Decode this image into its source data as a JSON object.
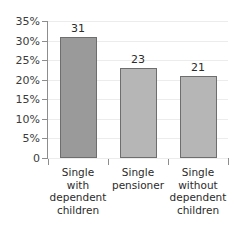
{
  "chart_data": {
    "type": "bar",
    "title": "",
    "subtitle": "",
    "xlabel": "",
    "ylabel": "",
    "categories": [
      "Single with dependent children",
      "Single pensioner",
      "Single without dependent children"
    ],
    "category_lines": [
      [
        "Single",
        "with",
        "dependent",
        "children"
      ],
      [
        "Single",
        "pensioner"
      ],
      [
        "Single",
        "without",
        "dependent",
        "children"
      ]
    ],
    "values": [
      31,
      23,
      21
    ],
    "value_labels": [
      "31",
      "23",
      "21"
    ],
    "bar_colors": [
      "#9a9a9a",
      "#b6b6b6",
      "#b6b6b6"
    ],
    "bar_border_color": "#6e6e6e",
    "ylim": [
      0,
      35
    ],
    "yticks": [
      0,
      5,
      10,
      15,
      20,
      25,
      30,
      35
    ],
    "ytick_labels": [
      "0",
      "5%",
      "10%",
      "15%",
      "20%",
      "25%",
      "30%",
      "35%"
    ],
    "grid": true,
    "grid_color": "#ececec",
    "axis_color": "#8d8d8d",
    "legend": null,
    "legend_position": "none",
    "background": "#ffffff"
  }
}
